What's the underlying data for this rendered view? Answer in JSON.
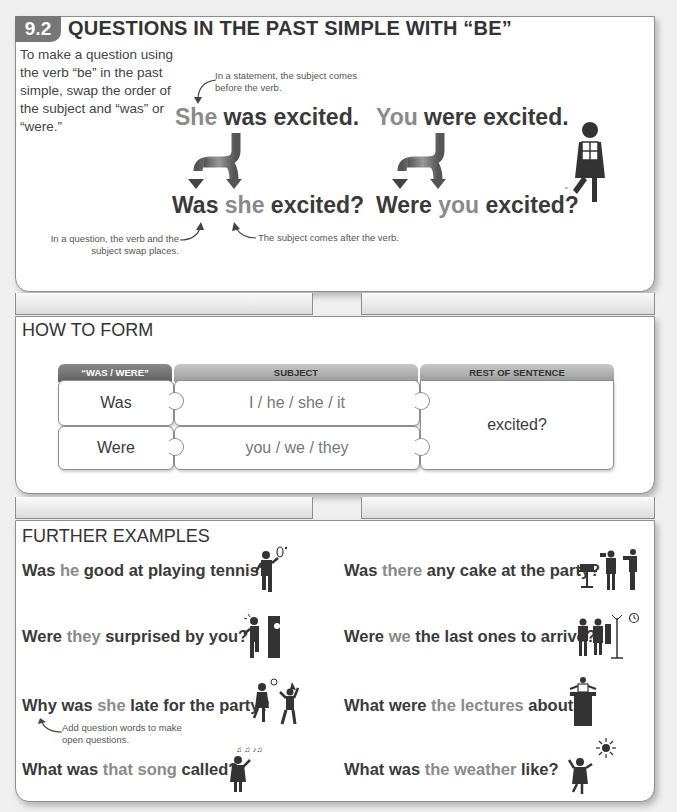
{
  "section1": {
    "badge": "9.2",
    "title": "QUESTIONS IN THE PAST SIMPLE WITH “BE”",
    "intro": "To make a question using the verb “be” in the past simple, swap the order of the subject and “was” or “were.”",
    "note_statement": "In a statement, the subject comes before the verb.",
    "note_question": "In a question, the verb and the subject swap places.",
    "note_subject_after": "The subject comes after the verb.",
    "example1": {
      "statement": {
        "subject": "She",
        "rest": " was excited."
      },
      "question": {
        "verb": "Was ",
        "subject": "she",
        "rest": " excited?"
      }
    },
    "example2": {
      "statement": {
        "subject": "You",
        "rest": " were excited."
      },
      "question": {
        "verb": "Were ",
        "subject": "you",
        "rest": " excited?"
      }
    }
  },
  "section2": {
    "heading": "HOW TO FORM",
    "columns": [
      "“WAS / WERE”",
      "SUBJECT",
      "REST OF SENTENCE"
    ],
    "rows": [
      {
        "verb": "Was",
        "subject": "I / he / she / it"
      },
      {
        "verb": "Were",
        "subject": "you / we / they"
      }
    ],
    "rest": "excited?"
  },
  "section3": {
    "heading": "FURTHER EXAMPLES",
    "note_open": "Add question words to make open questions.",
    "left": [
      {
        "a": "Was ",
        "b": "he",
        "c": " good at playing tennis?",
        "icon": "tennis-player-icon"
      },
      {
        "a": "Were ",
        "b": "they",
        "c": " surprised by you?",
        "icon": "surprised-people-icon"
      },
      {
        "a": "Why was ",
        "b": "she",
        "c": " late for the party?",
        "icon": "late-party-icon"
      },
      {
        "a": "What was ",
        "b": "that song",
        "c": " called?",
        "icon": "singing-person-icon"
      }
    ],
    "right": [
      {
        "a": "Was ",
        "b": "there",
        "c": " any cake at the party?",
        "icon": "cake-party-icon"
      },
      {
        "a": "Were ",
        "b": "we",
        "c": " the last ones to arrive?",
        "icon": "arriving-guests-icon"
      },
      {
        "a": "What were ",
        "b": "the lectures",
        "c": " about?",
        "icon": "lecturer-podium-icon"
      },
      {
        "a": "What was ",
        "b": "the weather",
        "c": " like?",
        "icon": "sunny-weather-icon"
      }
    ]
  }
}
